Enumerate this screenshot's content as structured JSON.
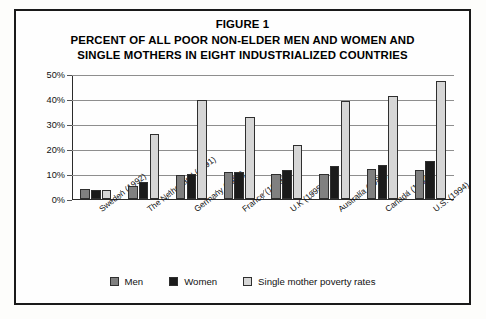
{
  "figure": {
    "title_lines": [
      "FIGURE 1",
      "PERCENT OF ALL POOR NON-ELDER MEN AND WOMEN AND",
      "SINGLE MOTHERS IN EIGHT INDUSTRIALIZED COUNTRIES"
    ]
  },
  "legend": {
    "items": [
      {
        "label": "Men",
        "color": "#808080",
        "swatch": "men"
      },
      {
        "label": "Women",
        "color": "#1b1b1b",
        "swatch": "women"
      },
      {
        "label": "Single mother poverty rates",
        "color": "#d6d6d6",
        "swatch": "single"
      }
    ]
  },
  "chart_data": {
    "type": "bar",
    "title": "PERCENT OF ALL POOR NON-ELDER MEN AND WOMEN AND SINGLE MOTHERS IN EIGHT INDUSTRIALIZED COUNTRIES",
    "xlabel": "",
    "ylabel": "Percent poor",
    "ylim": [
      0,
      50
    ],
    "ytick_labels": [
      "0%",
      "10%",
      "20%",
      "30%",
      "40%",
      "50%"
    ],
    "ytick_values": [
      0,
      10,
      20,
      30,
      40,
      50
    ],
    "grid": true,
    "legend_position": "bottom",
    "categories": [
      "Sweden (1992)",
      "The Netherland (1991)",
      "Germany (1994)",
      "France (1989)",
      "U.K (1995)",
      "Australia (1989)",
      "Canada (1994)",
      "U.S. (1994)"
    ],
    "series": [
      {
        "name": "Men",
        "color": "#808080",
        "values": [
          4,
          5,
          9.5,
          10.5,
          10,
          10,
          12,
          11.5
        ]
      },
      {
        "name": "Women",
        "color": "#1b1b1b",
        "values": [
          3.5,
          6.5,
          10,
          10.5,
          11.5,
          13,
          13.5,
          15
        ]
      },
      {
        "name": "Single mother poverty rates",
        "color": "#d6d6d6",
        "values": [
          3.5,
          26,
          39.5,
          32.5,
          21.5,
          39,
          41,
          47
        ]
      }
    ]
  }
}
